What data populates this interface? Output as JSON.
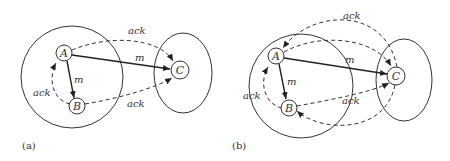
{
  "panels": [
    {
      "id": "a",
      "label": "(a)",
      "nodes": {
        "A": "A",
        "B": "B",
        "C": "C"
      },
      "edges": {
        "a_to_c": "m",
        "a_to_b": "m",
        "b_to_a": "ack",
        "a_to_c_ack": "ack",
        "b_to_c_ack": "ack"
      }
    },
    {
      "id": "b",
      "label": "(b)",
      "nodes": {
        "A": "A",
        "B": "B",
        "C": "C"
      },
      "edges": {
        "a_to_c": "m",
        "a_to_b": "m",
        "b_to_a": "ack",
        "c_to_a_ack": "ack",
        "b_to_c_ack": "ack"
      }
    }
  ],
  "colors": {
    "stroke": "#333333",
    "background": "#ffffff"
  }
}
